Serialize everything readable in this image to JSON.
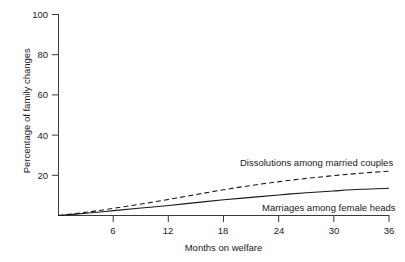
{
  "chart_data": {
    "type": "line",
    "title": "",
    "subtitle": "",
    "xlabel": "Months on welfare",
    "ylabel": "Percentage of family changes",
    "xlim": [
      0,
      36
    ],
    "ylim": [
      0,
      100
    ],
    "xticks": [
      6,
      12,
      18,
      24,
      30,
      36
    ],
    "yticks": [
      20,
      40,
      60,
      80,
      100
    ],
    "grid": false,
    "legend_position": "inline-annotation",
    "x": [
      0,
      3,
      6,
      9,
      12,
      15,
      18,
      21,
      24,
      27,
      30,
      33,
      36
    ],
    "series": [
      {
        "name": "Dissolutions among married couples",
        "style": "dashed",
        "color": "#1a1a1a",
        "values": [
          0,
          1.6,
          3.6,
          5.7,
          8.0,
          10.4,
          12.8,
          14.9,
          16.8,
          18.4,
          19.8,
          21.0,
          22.0
        ]
      },
      {
        "name": "Marriages among female heads",
        "style": "solid",
        "color": "#1a1a1a",
        "values": [
          0,
          1.1,
          2.4,
          3.7,
          5.0,
          6.4,
          7.8,
          9.0,
          10.2,
          11.3,
          12.2,
          13.0,
          13.5
        ]
      }
    ],
    "annotations": [
      {
        "id": "dissolutions",
        "text": "Dissolutions among married couples"
      },
      {
        "id": "marriages",
        "text": "Marriages among female heads"
      }
    ]
  },
  "axes": {
    "x_title": "Months on welfare",
    "y_title": "Percentage of family changes",
    "x_tick_labels": [
      "6",
      "12",
      "18",
      "24",
      "30",
      "36"
    ],
    "y_tick_labels": [
      "20",
      "40",
      "60",
      "80",
      "100"
    ]
  },
  "annotations": {
    "dissolutions_label": "Dissolutions among married couples",
    "marriages_label": "Marriages among female heads"
  },
  "colors": {
    "background": "#ffffff",
    "axis": "#3a3a3a",
    "text": "#1a1a1a",
    "series_dashed": "#1a1a1a",
    "series_solid": "#1a1a1a"
  }
}
